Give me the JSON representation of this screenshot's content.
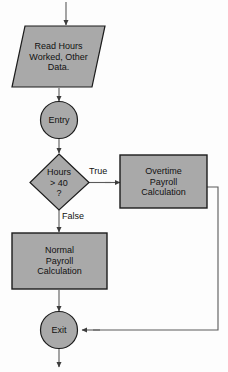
{
  "diagram": {
    "canvas": {
      "width": 228,
      "height": 372
    },
    "style": {
      "shape_fill": "#a9a9a9",
      "shape_stroke": "#1a1a1a",
      "line_color": "#4a4a4a",
      "text_color": "#111111",
      "background": "#fdfdfd"
    },
    "nodes": {
      "read_input": {
        "shape": "parallelogram",
        "lines": [
          "Read Hours",
          "Worked, Other",
          "Data."
        ],
        "line1": "Read Hours",
        "line2": "Worked, Other",
        "line3": "Data."
      },
      "entry": {
        "shape": "circle",
        "label": "Entry"
      },
      "decision": {
        "shape": "diamond",
        "lines": [
          "Hours",
          "> 40",
          "?"
        ],
        "line1": "Hours",
        "line2": "> 40",
        "line3": "?"
      },
      "overtime": {
        "shape": "rectangle",
        "lines": [
          "Overtime",
          "Payroll",
          "Calculation"
        ],
        "line1": "Overtime",
        "line2": "Payroll",
        "line3": "Calculation"
      },
      "normal": {
        "shape": "rectangle",
        "lines": [
          "Normal",
          "Payroll",
          "Calculation"
        ],
        "line1": "Normal",
        "line2": "Payroll",
        "line3": "Calculation"
      },
      "exit": {
        "shape": "circle",
        "label": "Exit"
      }
    },
    "edges": {
      "true_branch": "True",
      "false_branch": "False"
    }
  }
}
